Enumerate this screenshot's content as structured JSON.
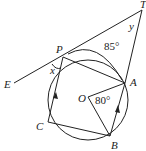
{
  "diagram": {
    "type": "circle-geometry",
    "points": {
      "T": {
        "label": "T"
      },
      "P": {
        "label": "P"
      },
      "A": {
        "label": "A"
      },
      "O": {
        "label": "O"
      },
      "B": {
        "label": "B"
      },
      "C": {
        "label": "C"
      },
      "E": {
        "label": "E"
      }
    },
    "angles": {
      "PA_arc": "85°",
      "AOB": "80°",
      "x": "x",
      "y": "y"
    },
    "colors": {
      "stroke": "#222222",
      "background": "#ffffff"
    }
  }
}
